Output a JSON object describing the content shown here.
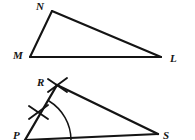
{
  "figure": {
    "background_color": "#ffffff",
    "stroke_color": "#141414",
    "label_color": "#141414",
    "width": 195,
    "height": 140
  },
  "top_figure": {
    "name": "triangle-mnl",
    "description": "Scalene triangle with vertices M, N and L",
    "vertices": [
      {
        "label": "M",
        "x": 30,
        "y": 57,
        "label_x": 13,
        "label_y": 59
      },
      {
        "label": "N",
        "x": 52,
        "y": 11,
        "label_x": 36,
        "label_y": 10
      },
      {
        "label": "L",
        "x": 161,
        "y": 57,
        "label_x": 170,
        "label_y": 62
      }
    ],
    "edges": [
      {
        "name": "segment-mn",
        "from": "M",
        "to": "N"
      },
      {
        "name": "segment-nl",
        "from": "N",
        "to": "L"
      },
      {
        "name": "segment-ml",
        "from": "M",
        "to": "L"
      }
    ]
  },
  "bottom_figure": {
    "name": "triangle-prs",
    "description": "Partially cropped construction triangle with vertices P, R and S, showing congruence tick marks on side PR and an angle arc at P",
    "vertices": [
      {
        "label": "R",
        "x": 57,
        "y": 85,
        "label_x": 37,
        "label_y": 86
      },
      {
        "label": "P",
        "x": 25,
        "y": 140,
        "label_x": 13,
        "label_y": 139
      },
      {
        "label": "S",
        "x": 158,
        "y": 134,
        "label_x": 163,
        "label_y": 139
      }
    ],
    "edges": [
      {
        "name": "segment-pr",
        "from": "P",
        "to": "R"
      },
      {
        "name": "segment-rs",
        "from": "R",
        "to": "S"
      },
      {
        "name": "segment-ps",
        "from": "P",
        "to": "S"
      }
    ],
    "tick_marks": [
      {
        "name": "tick-mark-upper",
        "x": 57,
        "y": 85,
        "style": "x-cross"
      },
      {
        "name": "tick-mark-lower",
        "x": 38,
        "y": 112,
        "style": "x-cross"
      }
    ],
    "angle_arc": {
      "name": "angle-arc-p",
      "vertex": "P",
      "center_x": 25,
      "center_y": 140,
      "radius": 46
    }
  }
}
